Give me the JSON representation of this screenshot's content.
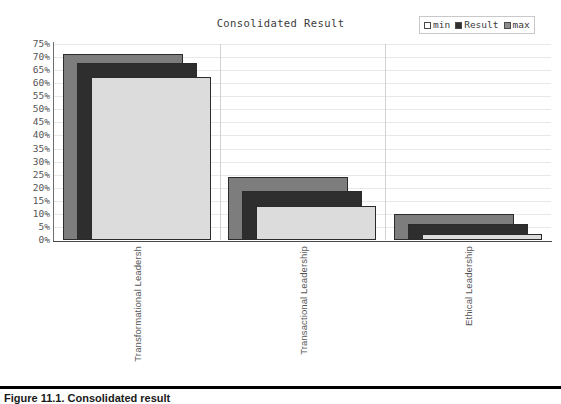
{
  "chart_data": {
    "type": "bar",
    "title": "Consolidated Result",
    "xlabel": "",
    "ylabel": "",
    "ylim": [
      0,
      75
    ],
    "ytick_step": 5,
    "ytick_labels": [
      "75%",
      "70%",
      "65%",
      "60%",
      "55%",
      "50%",
      "45%",
      "40%",
      "35%",
      "30%",
      "25%",
      "20%",
      "15%",
      "10%",
      "5%",
      "0%"
    ],
    "grid": true,
    "legend_position": "top-right",
    "style": "overlapping-offset-3d",
    "categories": [
      "Transformational Leadersh",
      "Transactional Leadership",
      "Ethical Leadership"
    ],
    "series": [
      {
        "name": "min",
        "color": "#7d7d7d",
        "values": [
          71,
          24,
          10
        ]
      },
      {
        "name": "Result",
        "color": "#2e2e2e",
        "values": [
          70,
          21,
          8.5
        ]
      },
      {
        "name": "max",
        "color": "#dcdcdc",
        "values": [
          67,
          17.5,
          7
        ]
      }
    ]
  },
  "chart": {
    "title": "Consolidated Result"
  },
  "legend": {
    "items": [
      {
        "label": "min",
        "swatch": "#ffffff"
      },
      {
        "label": "Result",
        "swatch": "#2e2e2e"
      },
      {
        "label": "max",
        "swatch": "#8c8c8c"
      }
    ]
  },
  "caption": {
    "text": "Figure 11.1. Consolidated result"
  }
}
